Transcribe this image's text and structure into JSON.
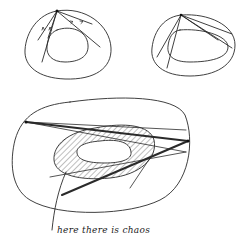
{
  "figure": {
    "caption": "here there is chaos",
    "diagrams": [
      {
        "id": "top-left",
        "description": "Billiard in annular region: convex outer boundary with inner oval, chords from a vertex with arrows"
      },
      {
        "id": "top-right",
        "description": "Billiard in annular region: chords from a vertex forming triangle-like trajectory with arrows"
      },
      {
        "id": "bottom",
        "description": "Large outer boundary with hatched annular chaotic zone around inner oval; bold and thin trajectories"
      }
    ],
    "colors": {
      "ink": "#2a2a2a",
      "background": "#ffffff"
    }
  }
}
